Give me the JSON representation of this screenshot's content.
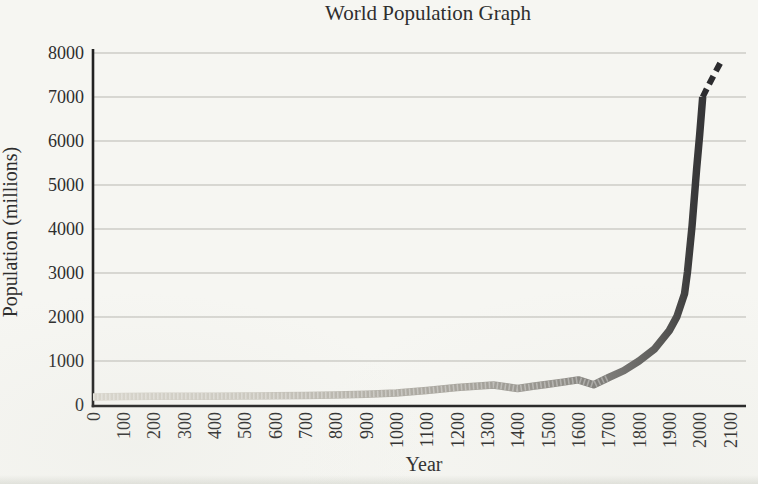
{
  "page": {
    "title": "World Population Graph"
  },
  "colors": {
    "background": "#f6f6f2",
    "axis": "#222222",
    "gridline": "#b3b1ab",
    "text": "#2e2e2e",
    "projection_line": "#2c2c2f",
    "texture_overlay": "#ffffff"
  },
  "chart_data": {
    "type": "line",
    "title": "World Population Graph",
    "xlabel": "Year",
    "ylabel": "Population (millions)",
    "xlim": [
      0,
      2100
    ],
    "ylim": [
      0,
      8000
    ],
    "grid": "horizontal",
    "legend": "none",
    "x_ticks": [
      0,
      100,
      200,
      300,
      400,
      500,
      600,
      700,
      800,
      900,
      1000,
      1100,
      1200,
      1300,
      1400,
      1500,
      1600,
      1700,
      1800,
      1900,
      2000,
      2100
    ],
    "y_ticks": [
      0,
      1000,
      2000,
      3000,
      4000,
      5000,
      6000,
      7000,
      8000
    ],
    "series": [
      {
        "name": "World population (historical)",
        "style": "solid",
        "stroke": "gradient",
        "points": [
          [
            0,
            185
          ],
          [
            100,
            192
          ],
          [
            200,
            197
          ],
          [
            300,
            198
          ],
          [
            400,
            200
          ],
          [
            500,
            205
          ],
          [
            600,
            210
          ],
          [
            700,
            217
          ],
          [
            800,
            228
          ],
          [
            900,
            245
          ],
          [
            1000,
            275
          ],
          [
            1100,
            330
          ],
          [
            1200,
            395
          ],
          [
            1260,
            428
          ],
          [
            1320,
            455
          ],
          [
            1400,
            375
          ],
          [
            1450,
            425
          ],
          [
            1500,
            470
          ],
          [
            1550,
            520
          ],
          [
            1600,
            570
          ],
          [
            1650,
            460
          ],
          [
            1700,
            625
          ],
          [
            1750,
            780
          ],
          [
            1800,
            1000
          ],
          [
            1850,
            1265
          ],
          [
            1900,
            1690
          ],
          [
            1925,
            2010
          ],
          [
            1950,
            2525
          ],
          [
            1960,
            3030
          ],
          [
            1975,
            4080
          ],
          [
            1990,
            5360
          ],
          [
            2000,
            6150
          ],
          [
            2010,
            7000
          ]
        ]
      },
      {
        "name": "World population (projected)",
        "style": "dashed",
        "stroke": "#2c2c2f",
        "points": [
          [
            2010,
            7000
          ],
          [
            2030,
            7280
          ],
          [
            2050,
            7540
          ],
          [
            2070,
            7800
          ]
        ]
      }
    ],
    "line_gradient_stops": [
      {
        "offset": 0.0,
        "color": "#d9d6cd"
      },
      {
        "offset": 0.25,
        "color": "#cbc8bf"
      },
      {
        "offset": 0.45,
        "color": "#b0ada5"
      },
      {
        "offset": 0.6,
        "color": "#a3a099"
      },
      {
        "offset": 0.72,
        "color": "#8e8c86"
      },
      {
        "offset": 0.8,
        "color": "#757471"
      },
      {
        "offset": 0.87,
        "color": "#565654"
      },
      {
        "offset": 0.92,
        "color": "#39393a"
      },
      {
        "offset": 1.0,
        "color": "#2b2b2e"
      }
    ]
  }
}
